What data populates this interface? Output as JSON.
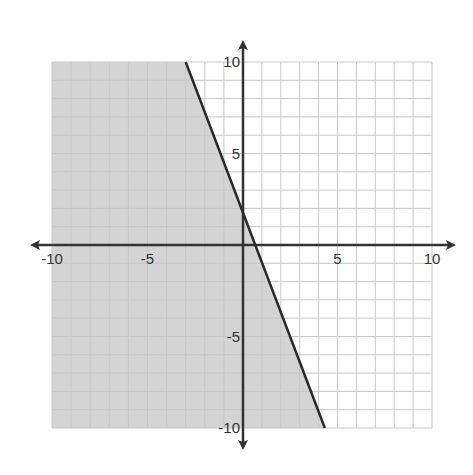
{
  "chart_data": {
    "type": "inequality-graph",
    "title": "",
    "xlabel": "",
    "ylabel": "",
    "xlim": [
      -10,
      10
    ],
    "ylim": [
      -10,
      10
    ],
    "grid": true,
    "grid_step": 1,
    "x_tick_labels": [
      "-10",
      "-5",
      "5",
      "10"
    ],
    "y_tick_labels": [
      "10",
      "5",
      "-5",
      "-10"
    ],
    "x_ticks": [
      -10,
      -5,
      5,
      10
    ],
    "y_ticks": [
      10,
      5,
      -5,
      -10
    ],
    "boundary_line": {
      "style": "solid",
      "points": [
        [
          -3,
          10
        ],
        [
          4.33,
          -10
        ]
      ],
      "approx_equation": "y = -3x + 2",
      "y_intercept": 2,
      "x_intercept": 0.67
    },
    "shaded_region": "left/below the line",
    "colors": {
      "shade": "#d4d4d4",
      "grid": "#c8c8c8",
      "axis": "#333333",
      "line": "#2a2a2a"
    }
  }
}
